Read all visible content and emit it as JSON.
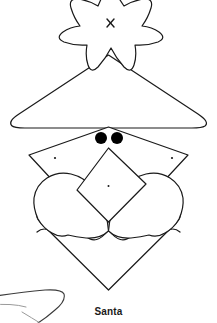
{
  "figure": {
    "caption": "Santa",
    "title": "Santa",
    "background_color": "#ffffff",
    "stroke_color": "#1a1a1a",
    "fill_color": "#ffffff",
    "eye_color": "#000000",
    "stroke_width": 1.2,
    "parts": [
      {
        "name": "star",
        "label": "star",
        "mark": "x"
      },
      {
        "name": "hat",
        "label": "hat triangle"
      },
      {
        "name": "face",
        "label": "face diamond"
      },
      {
        "name": "left-eye",
        "label": "left eye"
      },
      {
        "name": "right-eye",
        "label": "right eye"
      },
      {
        "name": "left-cheek-dot",
        "label": "left cheek dot"
      },
      {
        "name": "right-cheek-dot",
        "label": "right cheek dot"
      },
      {
        "name": "nose",
        "label": "nose diamond",
        "mark": "dot"
      },
      {
        "name": "left-mustache",
        "label": "left mustache lobe"
      },
      {
        "name": "right-mustache",
        "label": "right mustache lobe"
      },
      {
        "name": "beard",
        "label": "beard"
      },
      {
        "name": "stray-line",
        "label": "partial neighbouring sketch line"
      }
    ]
  }
}
